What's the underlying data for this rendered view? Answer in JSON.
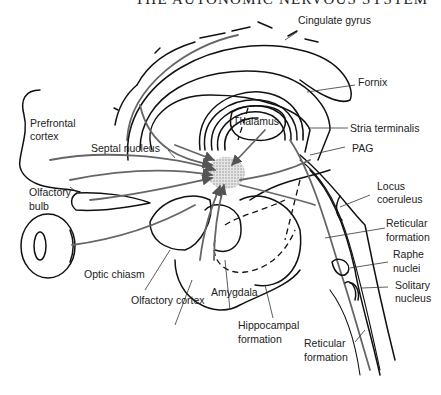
{
  "header": {
    "title": "THE AUTONOMIC NERVOUS SYSTEM"
  },
  "labels": {
    "cingulate_gyrus": "Cingulate gyrus",
    "fornix": "Fornix",
    "prefrontal_cortex_line1": "Prefrontal",
    "prefrontal_cortex_line2": "cortex",
    "thalamus": "Thalamus",
    "stria_terminalis": "Stria terminalis",
    "septal_nucleus": "Septal nucleus",
    "pag": "PAG",
    "olfactory_bulb_line1": "Olfactory",
    "olfactory_bulb_line2": "bulb",
    "locus_coeruleus_line1": "Locus",
    "locus_coeruleus_line2": "coeruleus",
    "reticular_formation_upper_line1": "Reticular",
    "reticular_formation_upper_line2": "formation",
    "optic_chiasm": "Optic chiasm",
    "raphe_nuclei_line1": "Raphe",
    "raphe_nuclei_line2": "nuclei",
    "solitary_nucleus_line1": "Solitary",
    "solitary_nucleus_line2": "nucleus",
    "olfactory_cortex": "Olfactory cortex",
    "amygdala": "Amygdala",
    "hippocampal_formation_line1": "Hippocampal",
    "hippocampal_formation_line2": "formation",
    "reticular_formation_lower_line1": "Reticular",
    "reticular_formation_lower_line2": "formation"
  },
  "colors": {
    "line": "#111111",
    "pathway": "#666666",
    "hub_fill": "#cfcfcf",
    "text": "#222222"
  }
}
